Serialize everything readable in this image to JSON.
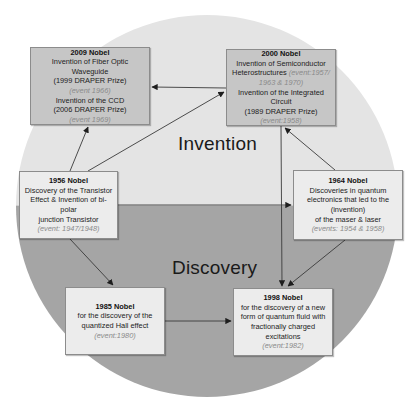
{
  "diagram": {
    "regions": {
      "top": {
        "label": "Invention",
        "color": "#e4e4e4"
      },
      "bottom": {
        "label": "Discovery",
        "color": "#a5a5a5"
      }
    },
    "nodes": {
      "n2009": {
        "title": "2009 Nobel",
        "line1": "Invention of Fiber Optic Waveguide",
        "line2": "(1999 DRAPER Prize)",
        "event1": "(event 1966)",
        "line3": "Invention of the CCD",
        "line4": "(2006 DRAPER Prize)",
        "event2": "(event 1969)"
      },
      "n2000": {
        "title": "2000 Nobel",
        "line1": "Invention of Semiconductor",
        "line2": "Heterostructures",
        "event1": "(event:1957/ 1963 & 1970)",
        "line3": "Invention of the Integrated",
        "line4": "Circuit",
        "line5": "(1989 DRAPER Prize)",
        "event2": "(event:1958)"
      },
      "n1956": {
        "title": "1956 Nobel",
        "line1": "Discovery of the  Transistor",
        "line2": "Effect & Invention of bi-polar",
        "line3": "junction Transistor",
        "event": "(event: 1947/1948)"
      },
      "n1964": {
        "title": "1964 Nobel",
        "line1": "Discoveries in quantum",
        "line2": "electronics that led to the",
        "line3": "(invention)",
        "line4": "of  the maser & laser",
        "event": "(events: 1954 & 1958)"
      },
      "n1985": {
        "title": "1985 Nobel",
        "line1": "for the discovery of the",
        "line2": "quantized Hall effect",
        "event": "(event:1980)"
      },
      "n1998": {
        "title": "1998 Nobel",
        "line1": "for the discovery of a new",
        "line2": "form of quantum fluid with",
        "line3": "fractionally charged",
        "line4": "excitations",
        "event": "(event:1982)"
      }
    },
    "edges": [
      {
        "from": "2000 Nobel",
        "to": "2009 Nobel"
      },
      {
        "from": "1956 Nobel",
        "to": "2009 Nobel"
      },
      {
        "from": "1956 Nobel",
        "to": "2000 Nobel"
      },
      {
        "from": "1964 Nobel",
        "to": "2000 Nobel"
      },
      {
        "from": "1956 Nobel",
        "to": "1964 Nobel"
      },
      {
        "from": "1956 Nobel",
        "to": "1985 Nobel"
      },
      {
        "from": "2000 Nobel",
        "to": "1998 Nobel"
      },
      {
        "from": "1964 Nobel",
        "to": "1998 Nobel"
      },
      {
        "from": "1985 Nobel",
        "to": "1998 Nobel"
      }
    ]
  }
}
